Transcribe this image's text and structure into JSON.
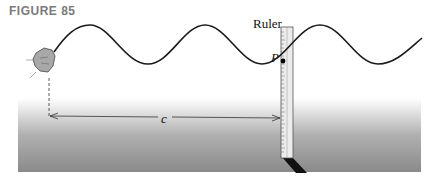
{
  "figure": {
    "title": "FIGURE 85",
    "labels": {
      "ruler": "Ruler",
      "point": "P",
      "distance": "c"
    },
    "elements": {
      "wave": "sinusoidal-string",
      "ruler": "vertical-ruler",
      "rock": "rock-source",
      "ground": "ground-block",
      "arrow": "double-headed-arrow"
    },
    "colors": {
      "wave": "#1a1a1a",
      "ground_top": "#f2f2f2",
      "ground_bottom": "#8c8c8c",
      "ruler": "#e6e6e6",
      "shadow": "#111111",
      "title": "#7a7a7a"
    }
  }
}
